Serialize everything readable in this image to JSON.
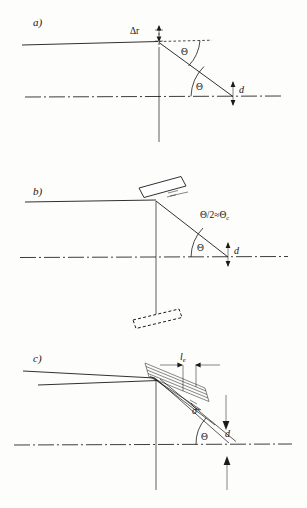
{
  "figure": {
    "background_color": "#fdfdfc",
    "ink_color": "#1a1a1a",
    "width": 307,
    "height": 508
  },
  "panels": [
    {
      "id": "a",
      "label": "a)",
      "description": "Flat perfect crystal: incident beam, reflected beam, Bragg angle theta, penetration depth d, radial offset delta-r",
      "labels": {
        "delta_r": "Δr",
        "theta_top": "Θ",
        "theta_bottom": "Θ",
        "thickness": "d"
      }
    },
    {
      "id": "b",
      "label": "b)",
      "description": "Single tilted mosaic block: slab rotated about pivot, acceptance angle theta over two approximately theta-c, depth d",
      "labels": {
        "acceptance": "Θ/2≈Θ",
        "acceptance_sub": "c",
        "theta": "Θ",
        "thickness": "d"
      }
    },
    {
      "id": "c",
      "label": "c)",
      "description": "Stack of mosaic blocks: extinction length l-sub-e, mosaic spread sigma, Bragg angle theta, depth d, incoming and outgoing beams",
      "labels": {
        "extinction_length": "l",
        "extinction_length_sub": "e",
        "mosaic_spread": "σ",
        "theta": "Θ",
        "thickness": "d"
      }
    }
  ]
}
